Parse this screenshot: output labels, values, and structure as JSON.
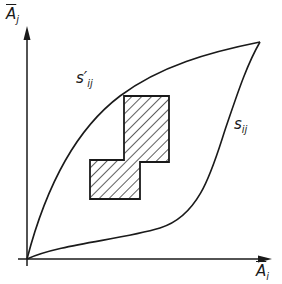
{
  "diagram": {
    "axes": {
      "y_label": {
        "base": "A",
        "bar": true,
        "subscript": "j"
      },
      "x_label": {
        "base": "A",
        "bar": true,
        "subscript": "i"
      },
      "origin": [
        27,
        259
      ],
      "y_axis_end": [
        27,
        28
      ],
      "x_axis_end": [
        270,
        259
      ]
    },
    "curves": [
      {
        "name": "s'_ij",
        "label_base": "s",
        "label_prime": "′",
        "label_subscript": "ij",
        "description": "upper boundary curve from origin to top-right point"
      },
      {
        "name": "s_ij",
        "label_base": "s",
        "label_prime": "",
        "label_subscript": "ij",
        "description": "lower boundary curve from origin to top-right point"
      }
    ],
    "shared_endpoint": [
      260,
      42
    ],
    "hatched_region": {
      "shape": "stepped polygon (two overlapping rectangles)",
      "vertices": [
        [
          124,
          96
        ],
        [
          169,
          96
        ],
        [
          169,
          162
        ],
        [
          140,
          162
        ],
        [
          140,
          199
        ],
        [
          90,
          199
        ],
        [
          90,
          160
        ],
        [
          124,
          160
        ]
      ],
      "fill": "diagonal hatching"
    },
    "colors": {
      "stroke": "#1a1a1a",
      "background": "#ffffff"
    }
  }
}
